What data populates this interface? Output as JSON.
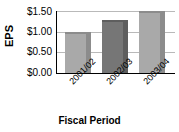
{
  "chart_data": {
    "type": "bar",
    "title": "",
    "xlabel": "Fiscal Period",
    "ylabel": "EPS",
    "categories": [
      "2001/02",
      "2002/03",
      "2003/04"
    ],
    "values": [
      0.98,
      1.28,
      1.5
    ],
    "ylim": [
      0.0,
      1.5
    ],
    "ytick_values": [
      1.5,
      1.0,
      0.5,
      0.0
    ],
    "ytick_labels": [
      "$1.50",
      "$1.00",
      "$0.50",
      "$0.00"
    ],
    "grid": true,
    "legend": false,
    "bar_colors": [
      "#a9a9a9",
      "#767676",
      "#a9a9a9"
    ],
    "bar_shade_colors": [
      "#8c8c8c",
      "#5e5e5e",
      "#8c8c8c"
    ],
    "grid_color": "#b9b9b9",
    "axis_color": "#000000"
  },
  "axes": {
    "y_title": "EPS",
    "x_title": "Fiscal Period"
  }
}
